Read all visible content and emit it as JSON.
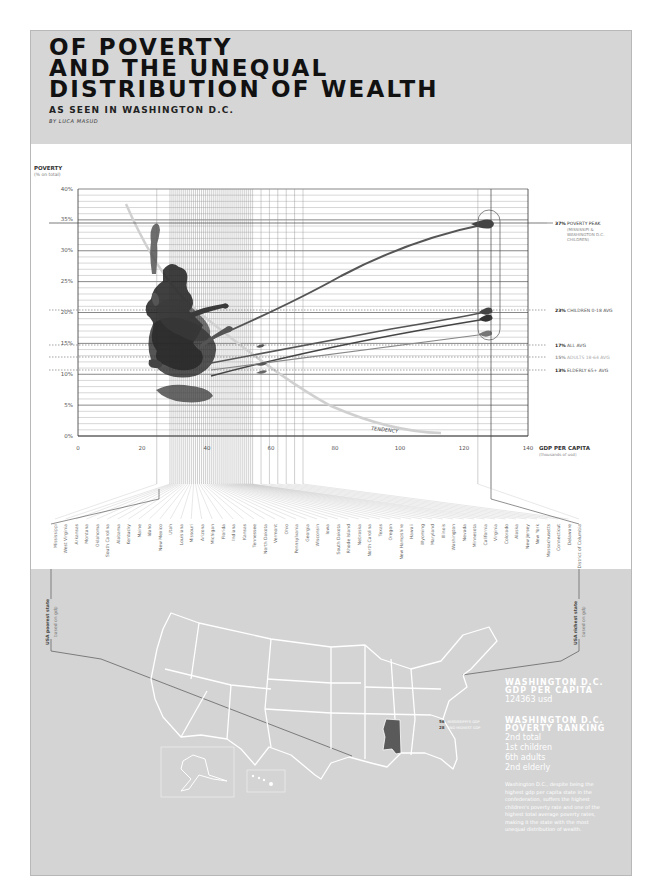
{
  "header": {
    "title_lines": [
      "OF POVERTY",
      "AND THE UNEQUAL",
      "DISTRIBUTION OF WEALTH"
    ],
    "subtitle": "AS SEEN IN WASHINGTON D.C.",
    "byline": "BY LUCA MASUD"
  },
  "chart_data": {
    "type": "scatter",
    "title": "Of Poverty and the Unequal Distribution of Wealth",
    "ylabel": "POVERTY",
    "ylabel_sub": "(% on total)",
    "xlabel": "GDP PER CAPITA",
    "xlabel_sub": "(thousands of usd)",
    "xlim": [
      0,
      140
    ],
    "ylim": [
      0,
      40
    ],
    "x_ticks": [
      "0",
      "20",
      "40",
      "60",
      "80",
      "100",
      "120",
      "140"
    ],
    "y_ticks": [
      "0%",
      "5%",
      "10%",
      "15%",
      "20%",
      "25%",
      "30%",
      "35%",
      "40%"
    ],
    "grid": true,
    "trend_label": "TENDENCY",
    "trend_line": [
      [
        15,
        37
      ],
      [
        30,
        22
      ],
      [
        50,
        12
      ],
      [
        80,
        5
      ],
      [
        110,
        0.5
      ]
    ],
    "highlight": {
      "label": "Washington D.C.",
      "x": 124.4
    },
    "series": [
      {
        "name": "Children 0-18",
        "dc_value": 37,
        "cluster_center": [
          33,
          20
        ]
      },
      {
        "name": "All",
        "dc_value": 23,
        "cluster_center": [
          33,
          15
        ]
      },
      {
        "name": "Adults 18-64",
        "dc_value": 21,
        "cluster_center": [
          34,
          13
        ]
      },
      {
        "name": "Elderly 65+",
        "dc_value": 18,
        "cluster_center": [
          35,
          10
        ]
      }
    ],
    "reference_lines": [
      {
        "value": 37,
        "bold": "37%",
        "label": "POVERTY PEAK",
        "note": "(MISSISSIPI & WASHINGTON D.C. CHILDREN)"
      },
      {
        "value": 23,
        "bold": "23%",
        "label": "CHILDREN 0-18 AVG"
      },
      {
        "value": 17,
        "bold": "17%",
        "label": "ALL AVG"
      },
      {
        "value": 15,
        "bold": "15%",
        "label": "ADULTS 18-64 AVG"
      },
      {
        "value": 13,
        "bold": "13%",
        "label": "ELDERLY 65+ AVG"
      }
    ],
    "states_by_gdp": [
      "Mississippi",
      "West Virginia",
      "Arkansas",
      "Montana",
      "Oklahoma",
      "South Carolina",
      "Alabama",
      "Kentucky",
      "Maine",
      "Idaho",
      "New Mexico",
      "Utah",
      "Louisiana",
      "Missouri",
      "Arizona",
      "Michigan",
      "Florida",
      "Indiana",
      "Kansas",
      "Tennessee",
      "North Dakota",
      "Vermont",
      "Ohio",
      "Pennsylvania",
      "Georgia",
      "Wisconsin",
      "Iowa",
      "South Dakota",
      "Rhode Island",
      "Nebraska",
      "North Carolina",
      "Texas",
      "Oregon",
      "New Hampshire",
      "Hawaii",
      "Wyoming",
      "Maryland",
      "Illinois",
      "Washington",
      "Nevada",
      "Minnesota",
      "California",
      "Virginia",
      "Colorado",
      "Alaska",
      "New Jersey",
      "New York",
      "Massachusetts",
      "Connecticut",
      "Delaware",
      "District of Columbia"
    ]
  },
  "bracket_labels": {
    "poorest_title": "USA poorest state",
    "poorest_sub": "based on gdp",
    "richest_title": "USA richest state",
    "richest_sub": "based on gdp"
  },
  "map": {
    "highlight_state": "Mississippi",
    "highlight_color": "#5a5a5a",
    "legend": [
      {
        "num": "56",
        "label": "MISSISSIPPI'S GDP"
      },
      {
        "num": "28",
        "label": "2ND HIGHEST GDP"
      }
    ]
  },
  "info": {
    "gdp_heading_1": "WASHINGTON D.C.",
    "gdp_heading_2": "GDP PER CAPITA",
    "gdp_value": "124363 usd",
    "rank_heading_1": "WASHINGTON D.C.",
    "rank_heading_2": "POVERTY RANKING",
    "ranks": [
      "2nd total",
      "1st children",
      "6th adults",
      "2nd elderly"
    ],
    "paragraph": "Washington D.C., despite being the highest gdp per capita state in the confederation, suffers the highest children's poverty rate and one of the highest total average poverty rates, making it the state with the most unequal distribution of wealth."
  },
  "colors": {
    "band": "#d6d6d6",
    "ink": "#1a1a1a",
    "blob": "#3a3a3a",
    "grid": "#9a9a9a",
    "trend": "#cfcfcf"
  }
}
